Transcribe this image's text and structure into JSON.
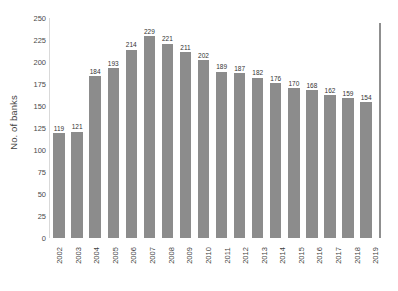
{
  "chart_data": {
    "type": "bar",
    "title": "",
    "xlabel": "",
    "ylabel": "No. of banks",
    "ylim": [
      0,
      250
    ],
    "grid": false,
    "legend": false,
    "bar_color": "#8c8c8c",
    "categories": [
      "2002",
      "2003",
      "2004",
      "2005",
      "2006",
      "2007",
      "2008",
      "2009",
      "2010",
      "2011",
      "2012",
      "2013",
      "2014",
      "2015",
      "2016",
      "2017",
      "2018",
      "2019"
    ],
    "values": [
      119,
      121,
      184,
      193,
      214,
      229,
      221,
      211,
      202,
      189,
      187,
      182,
      176,
      170,
      168,
      162,
      159,
      154
    ],
    "value_labels": [
      "119",
      "121",
      "184",
      "193",
      "214",
      "229",
      "221",
      "211",
      "202",
      "189",
      "187",
      "182",
      "176",
      "170",
      "168",
      "162",
      "159",
      "154"
    ],
    "yticks": [
      250,
      225,
      200,
      175,
      150,
      125,
      100,
      75,
      50,
      25,
      0
    ],
    "ytick_labels": [
      "250",
      "225",
      "200",
      "175",
      "150",
      "125",
      "100",
      "75",
      "50",
      "25",
      "0"
    ]
  }
}
